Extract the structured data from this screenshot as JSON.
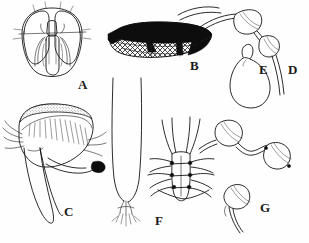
{
  "plate": {
    "title": "Taxonomic figure plate",
    "description": "Line-drawing plate of insect morphological structures, labelled A through G",
    "background_color": "#fefefe",
    "ink_color": "#141414",
    "width": 309,
    "height": 243
  },
  "figures": [
    {
      "id": "A",
      "label": "A",
      "name": "head-dorsal-view",
      "caption": "Head in dorsal view with compound eyes and mouthparts",
      "label_x": 78,
      "label_y": 78
    },
    {
      "id": "B",
      "label": "B",
      "name": "wing",
      "caption": "Wing with dark costal pigmentation and reticulate cells",
      "label_x": 190,
      "label_y": 59
    },
    {
      "id": "C",
      "label": "C",
      "name": "male-genitalia-lateral",
      "caption": "Setose terminal structure with darkened apex, lateral view",
      "label_x": 64,
      "label_y": 205
    },
    {
      "id": "D",
      "label": "D",
      "name": "spermathecae-pair-ducts",
      "caption": "Paired spermathecal capsules with elongate ducts",
      "label_x": 288,
      "label_y": 63
    },
    {
      "id": "E",
      "label": "E",
      "name": "spermatheca-single-large",
      "caption": "Single pyriform spermatheca with short neck",
      "label_x": 259,
      "label_y": 63
    },
    {
      "id": "F",
      "label": "F",
      "name": "abdominal-segment-apex",
      "caption": "Apical abdominal segments with lateral setae",
      "label_x": 155,
      "label_y": 214
    },
    {
      "id": "G",
      "label": "G",
      "name": "spermathecae-group",
      "caption": "Group of rounded spermathecae with sclerotised ducts",
      "label_x": 260,
      "label_y": 201
    }
  ]
}
